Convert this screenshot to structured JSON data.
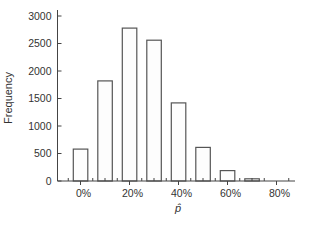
{
  "chart_data": {
    "type": "bar",
    "title": "",
    "xlabel": "p̂",
    "ylabel": "Frequency",
    "categories": [
      "0%",
      "10%",
      "20%",
      "30%",
      "40%",
      "50%",
      "60%",
      "70%"
    ],
    "values": [
      580,
      1820,
      2780,
      2560,
      1420,
      610,
      190,
      40
    ],
    "ylim": [
      0,
      3000
    ],
    "yticks": [
      0,
      500,
      1000,
      1500,
      2000,
      2500,
      3000
    ],
    "xlim": [
      "-5%",
      "85%"
    ],
    "xticks": [
      "0%",
      "20%",
      "40%",
      "60%",
      "80%"
    ],
    "grid": false,
    "legend": null
  }
}
